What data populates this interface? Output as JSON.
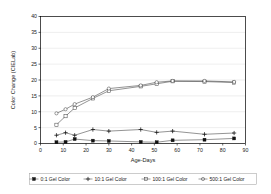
{
  "chart_data": {
    "type": "line",
    "title": "",
    "xlabel": "Age-Days",
    "ylabel": "Color Change (CIELab)",
    "xlim": [
      0,
      90
    ],
    "ylim": [
      0,
      40
    ],
    "xticks": [
      0,
      10,
      20,
      30,
      40,
      50,
      60,
      70,
      80,
      90
    ],
    "yticks": [
      0,
      5,
      10,
      15,
      20,
      25,
      30,
      35,
      40
    ],
    "grid": "horizontal",
    "legend_position": "bottom",
    "series": [
      {
        "name": "0:1 Gel Color",
        "marker": "filled-square",
        "x": [
          7,
          11,
          15,
          23,
          30,
          44,
          51,
          58,
          72,
          85
        ],
        "y": [
          0.4,
          0.5,
          1.4,
          0.9,
          0.8,
          0.5,
          0.4,
          1.0,
          1.2,
          1.6
        ]
      },
      {
        "name": "10:1 Gel Color",
        "marker": "plus",
        "x": [
          7,
          11,
          15,
          23,
          30,
          44,
          51,
          58,
          72,
          85
        ],
        "y": [
          2.6,
          3.4,
          2.6,
          4.4,
          3.9,
          4.4,
          3.5,
          3.9,
          2.9,
          3.3
        ]
      },
      {
        "name": "100:1 Gel Color",
        "marker": "open-square",
        "x": [
          7,
          11,
          15,
          23,
          30,
          44,
          51,
          58,
          72,
          85
        ],
        "y": [
          5.9,
          8.6,
          11.2,
          14.2,
          16.6,
          18.0,
          18.8,
          19.6,
          19.5,
          19.2
        ]
      },
      {
        "name": "500:1 Gel Color",
        "marker": "open-circle",
        "x": [
          7,
          11,
          15,
          23,
          30,
          44,
          51,
          58,
          72,
          85
        ],
        "y": [
          9.5,
          10.8,
          12.4,
          14.6,
          17.3,
          18.3,
          19.3,
          19.7,
          19.7,
          19.4
        ]
      }
    ]
  },
  "legend": {
    "entries": [
      {
        "label": "0:1 Gel Color",
        "marker": "filled-square"
      },
      {
        "label": "10:1 Gel Color",
        "marker": "plus"
      },
      {
        "label": "100:1 Gel Color",
        "marker": "open-square"
      },
      {
        "label": "500:1 Gel Color",
        "marker": "open-circle"
      }
    ]
  },
  "colors": {
    "series": "#3a3a3a",
    "frame": "#000000",
    "grid": "#d8d8d8",
    "text": "#1a1a1a"
  }
}
